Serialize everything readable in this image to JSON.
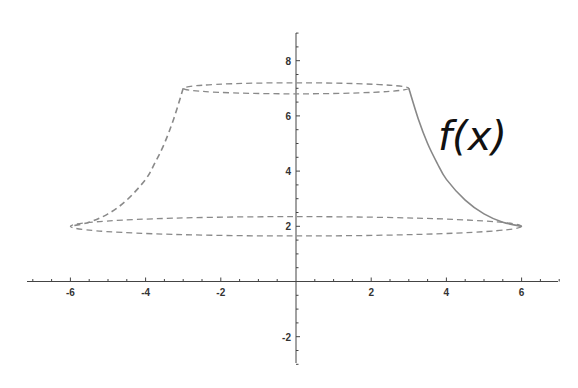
{
  "chart_data": {
    "type": "line",
    "title": "",
    "xlabel": "",
    "ylabel": "",
    "xlim": [
      -7,
      7.2
    ],
    "ylim": [
      -3,
      9
    ],
    "x_ticks": [
      -6,
      -4,
      -2,
      2,
      4,
      6
    ],
    "y_ticks": [
      -2,
      2,
      4,
      6,
      8
    ],
    "x_minor_tick_step": 0.5,
    "y_minor_tick_step": 0.5,
    "grid": false,
    "annotation": "f(x)",
    "series": [
      {
        "name": "f(x)",
        "style": "solid",
        "x": [
          3.0,
          3.25,
          3.5,
          3.75,
          4.0,
          4.5,
          5.0,
          5.5,
          6.0
        ],
        "y": [
          7.0,
          5.9,
          5.0,
          4.3,
          3.7,
          2.95,
          2.45,
          2.15,
          2.0
        ]
      },
      {
        "name": "f(x) mirrored (surface profile)",
        "style": "dashed",
        "x": [
          -3.0,
          -3.25,
          -3.5,
          -3.75,
          -4.0,
          -4.5,
          -5.0,
          -5.5,
          -6.0
        ],
        "y": [
          7.0,
          5.9,
          5.0,
          4.3,
          3.7,
          2.95,
          2.45,
          2.15,
          2.0
        ]
      },
      {
        "name": "top cross-section ellipse",
        "style": "dashed",
        "center": [
          0,
          7.0
        ],
        "radius_x": 3.0,
        "radius_y_visual": 0.2
      },
      {
        "name": "bottom cross-section ellipse",
        "style": "dashed",
        "center": [
          0,
          2.0
        ],
        "radius_x": 6.0,
        "radius_y_visual": 0.35
      }
    ]
  },
  "labels": {
    "function": "f(x)"
  },
  "colors": {
    "axis": "#444444",
    "curve": "#888888",
    "dashed": "#8a8a8a",
    "label": "#111111"
  }
}
